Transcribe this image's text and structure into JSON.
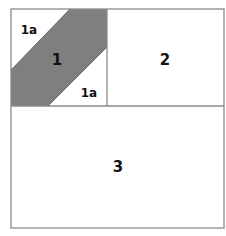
{
  "diagram": {
    "colors": {
      "border": "#8a8a8a",
      "fill": "#7f7f7f",
      "background": "#ffffff",
      "text": "#111111"
    },
    "regions": [
      {
        "id": "1",
        "label": "1",
        "fill": "gray"
      },
      {
        "id": "1a-top",
        "label": "1a",
        "fill": "white"
      },
      {
        "id": "1a-bottom",
        "label": "1a",
        "fill": "white"
      },
      {
        "id": "2",
        "label": "2",
        "fill": "white"
      },
      {
        "id": "3",
        "label": "3",
        "fill": "white"
      }
    ]
  }
}
